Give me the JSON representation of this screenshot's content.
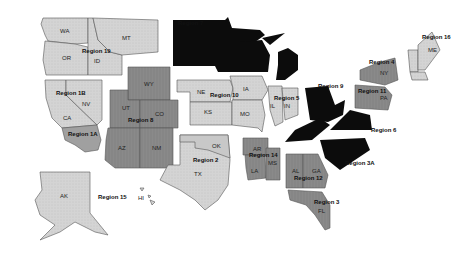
{
  "map": {
    "title": "",
    "colors": {
      "light": "#d2d2d2",
      "medium": "#8e8e8e",
      "medium_dark": "#7a7a7a",
      "dark": "#0c0c0c",
      "background": "#ffffff"
    },
    "regions": [
      {
        "name": "Region 1A",
        "states": [
          "CA"
        ]
      },
      {
        "name": "Region 1B",
        "states": [
          "CA",
          "NV"
        ]
      },
      {
        "name": "Region 2",
        "states": [
          "OK",
          "TX"
        ]
      },
      {
        "name": "Region 3",
        "states": [
          "FL"
        ]
      },
      {
        "name": "Region 3A",
        "states": [
          "NC"
        ]
      },
      {
        "name": "Region 4",
        "states": [
          "NY"
        ]
      },
      {
        "name": "Region 5",
        "states": [
          "IL",
          "IN"
        ]
      },
      {
        "name": "Region 6",
        "states": [
          "VA",
          "MD"
        ]
      },
      {
        "name": "Region 7",
        "states": [
          "ND",
          "SD",
          "MN",
          "WI",
          "MI"
        ]
      },
      {
        "name": "Region 8",
        "states": [
          "WY",
          "UT",
          "CO",
          "AZ",
          "NM"
        ]
      },
      {
        "name": "Region 9",
        "states": [
          "OH",
          "KY",
          "WV"
        ]
      },
      {
        "name": "Region 10",
        "states": [
          "NE",
          "IA",
          "KS",
          "MO"
        ]
      },
      {
        "name": "Region 11",
        "states": [
          "PA",
          "NJ"
        ]
      },
      {
        "name": "Region 12",
        "states": [
          "AL",
          "GA"
        ]
      },
      {
        "name": "Region 14",
        "states": [
          "AR",
          "LA",
          "MS"
        ]
      },
      {
        "name": "Region 15",
        "states": [
          "AK",
          "HI"
        ]
      },
      {
        "name": "Region 16",
        "states": [
          "ME",
          "NH",
          "VT",
          "MA",
          "CT",
          "RI"
        ]
      },
      {
        "name": "Region 19",
        "states": [
          "WA",
          "OR",
          "ID",
          "MT"
        ]
      }
    ],
    "labels": {
      "wa": "WA",
      "or": "OR",
      "id": "ID",
      "mt": "MT",
      "region19": "Region 19",
      "region1b": "Region 1B",
      "ca": "CA",
      "nv": "NV",
      "region1a": "Region 1A",
      "wy": "WY",
      "ut": "UT",
      "co": "CO",
      "az": "AZ",
      "nm": "NM",
      "region8": "Region 8",
      "region7": "Region 7",
      "ne": "NE",
      "ia": "IA",
      "ks": "KS",
      "mo": "MO",
      "region10": "Region 10",
      "il": "IL",
      "in": "IN",
      "region5": "Region 5",
      "region9": "Region 9",
      "ok": "OK",
      "tx": "TX",
      "region2": "Region 2",
      "ar": "AR",
      "la": "LA",
      "ms": "MS",
      "region14": "Region 14",
      "al": "AL",
      "ga": "GA",
      "region12": "Region 12",
      "fl": "FL",
      "region3": "Region 3",
      "region3a": "Region 3A",
      "region6": "Region 6",
      "ny": "NY",
      "region4": "Region 4",
      "pa": "PA",
      "region11": "Region 11",
      "me": "ME",
      "region16": "Region 16",
      "ak": "AK",
      "hi": "HI",
      "region15": "Region 15"
    }
  }
}
